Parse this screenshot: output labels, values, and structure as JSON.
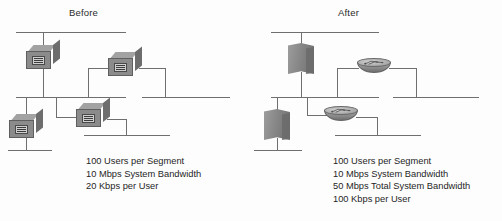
{
  "figure": {
    "name": "network-bandwidth-before-after-diagram",
    "background_color": "#fdfdfd",
    "line_color": "#6f6f6f",
    "text_color": "#1f1f1f"
  },
  "panels": [
    {
      "id": "before",
      "title": "Before",
      "devices": [
        {
          "type": "hub-switch",
          "icon": "switch-box-icon",
          "position": "top-left"
        },
        {
          "type": "hub-switch",
          "icon": "switch-box-icon",
          "position": "middle-right"
        },
        {
          "type": "hub-switch",
          "icon": "switch-box-icon",
          "position": "bottom-left"
        },
        {
          "type": "hub-switch",
          "icon": "switch-box-icon",
          "position": "bottom-middle"
        }
      ],
      "caption_lines": [
        "100 Users per Segment",
        "10 Mbps System Bandwidth",
        "20 Kbps per User"
      ]
    },
    {
      "id": "after",
      "title": "After",
      "devices": [
        {
          "type": "firewall",
          "icon": "firewall-wall-icon",
          "position": "top-left"
        },
        {
          "type": "router",
          "icon": "router-cylinder-icon",
          "position": "middle-right"
        },
        {
          "type": "firewall",
          "icon": "firewall-wall-icon",
          "position": "bottom-left"
        },
        {
          "type": "router",
          "icon": "router-cylinder-icon",
          "position": "bottom-middle"
        }
      ],
      "caption_lines": [
        "100 Users per Segment",
        "10 Mbps System Bandwidth",
        "50 Mbps Total System Bandwidth",
        "100 Kbps per User"
      ]
    }
  ]
}
